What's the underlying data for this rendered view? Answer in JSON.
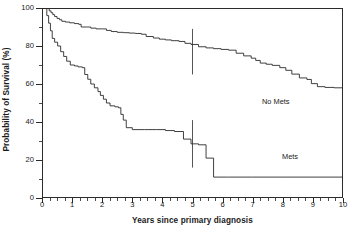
{
  "chart_data": {
    "type": "line",
    "subtype": "kaplan-meier-survival",
    "title": "",
    "xlabel": "Years since primary diagnosis",
    "ylabel": "Probability of Survival (%)",
    "xlim": [
      0,
      10
    ],
    "ylim": [
      0,
      100
    ],
    "xticks": [
      0,
      1,
      2,
      3,
      4,
      5,
      6,
      7,
      8,
      9,
      10
    ],
    "xtick_labels": [
      "0",
      "1",
      "2",
      "3",
      "4",
      "5",
      "6",
      "7",
      "8",
      "9",
      "10"
    ],
    "yticks": [
      0,
      20,
      40,
      60,
      80,
      100
    ],
    "ytick_labels": [
      "0",
      "20",
      "40",
      "60",
      "80",
      "100"
    ],
    "ytick_minor_step": 10,
    "xtick_minor_step": 0.25,
    "grid": false,
    "legend_position": "inline-annotation",
    "line_color": "#2b2b2b",
    "frame_color": "#2b2b2b",
    "background": "#ffffff",
    "series": [
      {
        "name": "No Mets",
        "label": "No Mets",
        "label_x": 7.35,
        "label_y": 55,
        "censor_bar": {
          "x": 5.0,
          "low": 65.0,
          "high": 89.0
        },
        "steps": [
          [
            0.0,
            100.0
          ],
          [
            0.2,
            100.0
          ],
          [
            0.24,
            98.5
          ],
          [
            0.3,
            97.5
          ],
          [
            0.36,
            96.5
          ],
          [
            0.42,
            95.5
          ],
          [
            0.5,
            94.5
          ],
          [
            0.58,
            93.8
          ],
          [
            0.66,
            93.0
          ],
          [
            0.78,
            92.6
          ],
          [
            0.92,
            92.2
          ],
          [
            1.08,
            91.8
          ],
          [
            1.22,
            91.4
          ],
          [
            1.3,
            90.0
          ],
          [
            1.5,
            90.0
          ],
          [
            1.62,
            89.4
          ],
          [
            1.8,
            89.0
          ],
          [
            2.0,
            89.0
          ],
          [
            2.14,
            88.2
          ],
          [
            2.3,
            87.6
          ],
          [
            2.5,
            87.2
          ],
          [
            2.7,
            87.0
          ],
          [
            2.9,
            86.8
          ],
          [
            3.1,
            86.6
          ],
          [
            3.3,
            86.2
          ],
          [
            3.46,
            85.0
          ],
          [
            3.7,
            84.2
          ],
          [
            3.9,
            83.6
          ],
          [
            4.1,
            83.2
          ],
          [
            4.3,
            82.8
          ],
          [
            4.55,
            82.4
          ],
          [
            4.75,
            81.4
          ],
          [
            4.95,
            80.8
          ],
          [
            5.2,
            79.6
          ],
          [
            5.45,
            79.0
          ],
          [
            5.7,
            78.6
          ],
          [
            5.95,
            78.2
          ],
          [
            6.2,
            77.8
          ],
          [
            6.45,
            76.2
          ],
          [
            6.7,
            74.8
          ],
          [
            6.95,
            73.6
          ],
          [
            7.1,
            72.4
          ],
          [
            7.25,
            71.0
          ],
          [
            7.45,
            70.4
          ],
          [
            7.65,
            69.8
          ],
          [
            7.9,
            68.6
          ],
          [
            8.1,
            67.2
          ],
          [
            8.3,
            65.2
          ],
          [
            8.55,
            63.2
          ],
          [
            8.8,
            62.4
          ],
          [
            8.95,
            60.2
          ],
          [
            9.15,
            58.6
          ],
          [
            9.4,
            58.2
          ],
          [
            9.7,
            58.0
          ],
          [
            10.0,
            58.0
          ]
        ]
      },
      {
        "name": "Mets",
        "label": "Mets",
        "label_x": 8.0,
        "label_y": 24,
        "censor_bar": {
          "x": 5.0,
          "low": 16.0,
          "high": 41.0
        },
        "steps": [
          [
            0.0,
            100.0
          ],
          [
            0.1,
            100.0
          ],
          [
            0.16,
            96.0
          ],
          [
            0.22,
            92.0
          ],
          [
            0.28,
            88.0
          ],
          [
            0.34,
            84.0
          ],
          [
            0.42,
            82.0
          ],
          [
            0.52,
            80.0
          ],
          [
            0.62,
            77.0
          ],
          [
            0.72,
            74.5
          ],
          [
            0.82,
            72.0
          ],
          [
            0.94,
            70.0
          ],
          [
            1.08,
            69.5
          ],
          [
            1.2,
            69.0
          ],
          [
            1.34,
            68.6
          ],
          [
            1.42,
            65.0
          ],
          [
            1.52,
            62.5
          ],
          [
            1.62,
            60.0
          ],
          [
            1.74,
            58.0
          ],
          [
            1.86,
            56.0
          ],
          [
            1.94,
            54.0
          ],
          [
            2.04,
            52.0
          ],
          [
            2.14,
            50.0
          ],
          [
            2.26,
            48.5
          ],
          [
            2.42,
            48.0
          ],
          [
            2.54,
            47.5
          ],
          [
            2.62,
            44.0
          ],
          [
            2.7,
            41.0
          ],
          [
            2.8,
            37.0
          ],
          [
            3.0,
            36.0
          ],
          [
            3.4,
            36.0
          ],
          [
            3.8,
            36.0
          ],
          [
            4.1,
            35.5
          ],
          [
            4.4,
            35.0
          ],
          [
            4.7,
            31.0
          ],
          [
            4.95,
            28.5
          ],
          [
            5.2,
            28.0
          ],
          [
            5.45,
            21.0
          ],
          [
            5.7,
            11.0
          ],
          [
            6.2,
            11.0
          ],
          [
            7.0,
            11.0
          ],
          [
            8.0,
            11.0
          ],
          [
            9.0,
            11.0
          ],
          [
            10.0,
            11.0
          ]
        ]
      }
    ]
  },
  "axes": {
    "x_title": "Years since primary diagnosis",
    "y_title": "Probability of Survival (%)"
  }
}
